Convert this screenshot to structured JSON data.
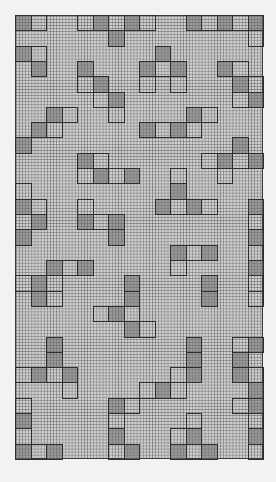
{
  "chart_data": {
    "type": "table",
    "title": "",
    "grid": {
      "columns": 16,
      "rows": 29,
      "cell_subdivisions": 5
    },
    "legend": {
      "d": "filled (dark) block",
      "o": "outlined block"
    },
    "rows": [
      [
        [
          0,
          "d"
        ],
        [
          1,
          "o"
        ],
        [
          4,
          "o"
        ],
        [
          5,
          "d"
        ],
        [
          6,
          "o"
        ],
        [
          7,
          "d"
        ],
        [
          8,
          "o"
        ],
        [
          11,
          "d"
        ],
        [
          12,
          "o"
        ],
        [
          13,
          "d"
        ],
        [
          14,
          "o"
        ],
        [
          15,
          "d"
        ]
      ],
      [
        [
          6,
          "d"
        ],
        [
          15,
          "o"
        ]
      ],
      [
        [
          0,
          "d"
        ],
        [
          1,
          "o"
        ],
        [
          9,
          "d"
        ]
      ],
      [
        [
          1,
          "d"
        ],
        [
          4,
          "d"
        ],
        [
          8,
          "d"
        ],
        [
          9,
          "o"
        ],
        [
          10,
          "d"
        ],
        [
          13,
          "d"
        ],
        [
          14,
          "o"
        ]
      ],
      [
        [
          4,
          "o"
        ],
        [
          5,
          "d"
        ],
        [
          8,
          "o"
        ],
        [
          10,
          "o"
        ],
        [
          14,
          "d"
        ],
        [
          15,
          "o"
        ]
      ],
      [
        [
          5,
          "o"
        ],
        [
          6,
          "d"
        ],
        [
          14,
          "o"
        ],
        [
          15,
          "d"
        ]
      ],
      [
        [
          2,
          "d"
        ],
        [
          3,
          "o"
        ],
        [
          6,
          "o"
        ],
        [
          11,
          "d"
        ],
        [
          12,
          "o"
        ]
      ],
      [
        [
          1,
          "d"
        ],
        [
          2,
          "o"
        ],
        [
          8,
          "d"
        ],
        [
          9,
          "o"
        ],
        [
          10,
          "d"
        ],
        [
          11,
          "o"
        ]
      ],
      [
        [
          0,
          "d"
        ],
        [
          14,
          "d"
        ]
      ],
      [
        [
          4,
          "d"
        ],
        [
          5,
          "o"
        ],
        [
          12,
          "o"
        ],
        [
          13,
          "d"
        ],
        [
          14,
          "o"
        ],
        [
          15,
          "d"
        ]
      ],
      [
        [
          4,
          "o"
        ],
        [
          5,
          "d"
        ],
        [
          6,
          "o"
        ],
        [
          7,
          "d"
        ],
        [
          10,
          "o"
        ],
        [
          13,
          "o"
        ]
      ],
      [
        [
          0,
          "o"
        ],
        [
          10,
          "d"
        ]
      ],
      [
        [
          0,
          "d"
        ],
        [
          1,
          "o"
        ],
        [
          4,
          "o"
        ],
        [
          9,
          "d"
        ],
        [
          10,
          "o"
        ],
        [
          11,
          "d"
        ],
        [
          12,
          "o"
        ],
        [
          15,
          "d"
        ]
      ],
      [
        [
          0,
          "o"
        ],
        [
          1,
          "d"
        ],
        [
          4,
          "d"
        ],
        [
          5,
          "o"
        ],
        [
          6,
          "d"
        ],
        [
          15,
          "o"
        ]
      ],
      [
        [
          0,
          "d"
        ],
        [
          6,
          "d"
        ],
        [
          15,
          "d"
        ]
      ],
      [
        [
          10,
          "d"
        ],
        [
          11,
          "o"
        ],
        [
          12,
          "d"
        ],
        [
          15,
          "o"
        ]
      ],
      [
        [
          2,
          "d"
        ],
        [
          3,
          "o"
        ],
        [
          4,
          "d"
        ],
        [
          10,
          "o"
        ],
        [
          15,
          "d"
        ]
      ],
      [
        [
          0,
          "o"
        ],
        [
          1,
          "d"
        ],
        [
          2,
          "o"
        ],
        [
          7,
          "d"
        ],
        [
          12,
          "d"
        ],
        [
          15,
          "o"
        ]
      ],
      [
        [
          1,
          "d"
        ],
        [
          2,
          "o"
        ],
        [
          7,
          "d"
        ],
        [
          12,
          "d"
        ],
        [
          15,
          "o"
        ]
      ],
      [
        [
          5,
          "o"
        ],
        [
          6,
          "d"
        ],
        [
          7,
          "o"
        ]
      ],
      [
        [
          7,
          "d"
        ],
        [
          8,
          "o"
        ]
      ],
      [
        [
          2,
          "d"
        ],
        [
          11,
          "d"
        ],
        [
          14,
          "o"
        ],
        [
          15,
          "d"
        ]
      ],
      [
        [
          2,
          "d"
        ],
        [
          11,
          "d"
        ],
        [
          14,
          "d"
        ]
      ],
      [
        [
          0,
          "o"
        ],
        [
          1,
          "d"
        ],
        [
          2,
          "o"
        ],
        [
          3,
          "d"
        ],
        [
          10,
          "o"
        ],
        [
          11,
          "d"
        ],
        [
          14,
          "d"
        ],
        [
          15,
          "o"
        ]
      ],
      [
        [
          3,
          "o"
        ],
        [
          8,
          "o"
        ],
        [
          9,
          "d"
        ],
        [
          10,
          "o"
        ],
        [
          15,
          "d"
        ]
      ],
      [
        [
          0,
          "o"
        ],
        [
          6,
          "d"
        ],
        [
          7,
          "o"
        ],
        [
          14,
          "o"
        ],
        [
          15,
          "d"
        ]
      ],
      [
        [
          0,
          "d"
        ],
        [
          6,
          "o"
        ],
        [
          11,
          "o"
        ],
        [
          15,
          "o"
        ]
      ],
      [
        [
          0,
          "o"
        ],
        [
          6,
          "d"
        ],
        [
          10,
          "o"
        ],
        [
          11,
          "d"
        ],
        [
          15,
          "d"
        ]
      ],
      [
        [
          0,
          "d"
        ],
        [
          1,
          "o"
        ],
        [
          2,
          "d"
        ],
        [
          6,
          "o"
        ],
        [
          7,
          "d"
        ],
        [
          10,
          "d"
        ],
        [
          11,
          "o"
        ],
        [
          12,
          "d"
        ],
        [
          15,
          "o"
        ]
      ]
    ],
    "colors": {
      "paper": "#f2f2f0",
      "grid": "#cfcfcd",
      "filled": "#8a8a8a",
      "outline": "#2e2e2e"
    }
  }
}
